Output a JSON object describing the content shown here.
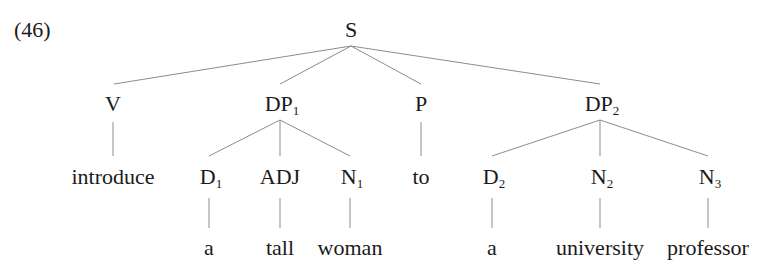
{
  "example_number": "(46)",
  "tree": {
    "root": {
      "label": "S",
      "sub": ""
    },
    "level1": [
      {
        "label": "V",
        "sub": ""
      },
      {
        "label": "DP",
        "sub": "1"
      },
      {
        "label": "P",
        "sub": ""
      },
      {
        "label": "DP",
        "sub": "2"
      }
    ],
    "level2": [
      {
        "label": "introduce",
        "sub": ""
      },
      {
        "label": "D",
        "sub": "1"
      },
      {
        "label": "ADJ",
        "sub": ""
      },
      {
        "label": "N",
        "sub": "1"
      },
      {
        "label": "to",
        "sub": ""
      },
      {
        "label": "D",
        "sub": "2"
      },
      {
        "label": "N",
        "sub": "2"
      },
      {
        "label": "N",
        "sub": "3"
      }
    ],
    "leaves": [
      {
        "label": "a"
      },
      {
        "label": "tall"
      },
      {
        "label": "woman"
      },
      {
        "label": "a"
      },
      {
        "label": "university"
      },
      {
        "label": "professor"
      }
    ]
  },
  "colors": {
    "edge": "#8c8c8c",
    "text": "#1a1a1a"
  }
}
